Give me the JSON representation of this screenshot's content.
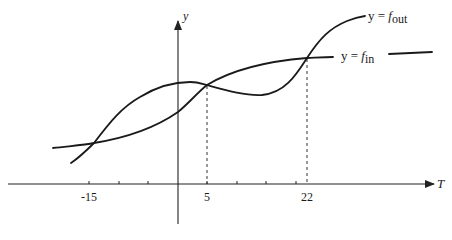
{
  "diagram": {
    "x_axis": {
      "label": "T"
    },
    "y_axis": {
      "label": "y"
    },
    "ticks": [
      {
        "value": "-15",
        "x": 89
      },
      {
        "value": "5",
        "x": 207
      },
      {
        "value": "22",
        "x": 307
      }
    ],
    "curves": {
      "f_out": {
        "label_prefix": "y = ",
        "label_italic": "f",
        "label_sub": "out"
      },
      "f_in": {
        "label_prefix": "y = ",
        "label_italic": "f",
        "label_sub": "in"
      }
    },
    "intersections_T": [
      "-15",
      "5",
      "22"
    ]
  }
}
